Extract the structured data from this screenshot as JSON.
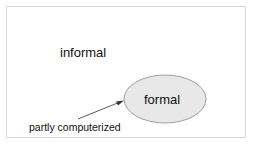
{
  "diagram": {
    "outer_label": "informal",
    "inner_label": "formal",
    "annotation": "partly computerized",
    "colors": {
      "frame_border": "#d6d6d6",
      "ellipse_fill": "#e8e8e8",
      "ellipse_stroke": "#8a8a8a",
      "arrow": "#333333"
    }
  }
}
